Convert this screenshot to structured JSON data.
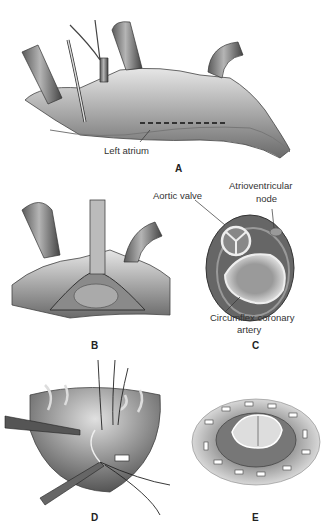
{
  "figure": {
    "panels": [
      {
        "id": "A",
        "label": "A",
        "annotations": [
          "Left atrium"
        ]
      },
      {
        "id": "B",
        "label": "B",
        "annotations": []
      },
      {
        "id": "C",
        "label": "C",
        "annotations": [
          "Aortic valve",
          "Atrioventricular node",
          "Circumflex coronary artery"
        ]
      },
      {
        "id": "D",
        "label": "D",
        "annotations": []
      },
      {
        "id": "E",
        "label": "E",
        "annotations": []
      }
    ],
    "labels": {
      "left_atrium": "Left atrium",
      "aortic_valve": "Aortic valve",
      "av_node_line1": "Atrioventricular",
      "av_node_line2": "node",
      "circumflex_line1": "Circumflex coronary",
      "circumflex_line2": "artery"
    }
  }
}
